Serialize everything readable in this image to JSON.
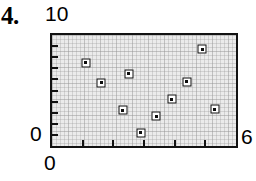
{
  "problem": {
    "number": "4."
  },
  "axis_labels": {
    "y_max": "10",
    "y_min": "0",
    "x_min": "0",
    "x_max": "6"
  },
  "colors": {
    "plot_background": "#ebebeb",
    "frame": "#121212",
    "marker_fill": "#ffffff",
    "marker_edge": "#0d0d0d",
    "text": "#000000"
  },
  "chart_data": {
    "type": "scatter",
    "title": "",
    "xlabel": "",
    "ylabel": "",
    "xlim": [
      0,
      6
    ],
    "ylim": [
      0,
      10
    ],
    "grid": true,
    "legend": null,
    "xticks": [
      0,
      1,
      2,
      3,
      4,
      5,
      6
    ],
    "yticks": [
      0,
      1,
      2,
      3,
      4,
      5,
      6,
      7,
      8,
      9,
      10
    ],
    "xtick_labels": [
      "0",
      "",
      "",
      "",
      "",
      "",
      "6"
    ],
    "ytick_labels": [
      "0",
      "",
      "",
      "",
      "",
      "",
      "",
      "",
      "",
      "",
      "10"
    ],
    "series": [
      {
        "name": "data",
        "marker": "square",
        "points": [
          {
            "x": 1.1,
            "y": 7.5
          },
          {
            "x": 1.6,
            "y": 5.7
          },
          {
            "x": 2.5,
            "y": 6.5
          },
          {
            "x": 2.3,
            "y": 3.2
          },
          {
            "x": 2.9,
            "y": 1.2
          },
          {
            "x": 3.4,
            "y": 2.7
          },
          {
            "x": 3.9,
            "y": 4.2
          },
          {
            "x": 4.4,
            "y": 5.8
          },
          {
            "x": 4.9,
            "y": 8.7
          },
          {
            "x": 5.3,
            "y": 3.3
          }
        ]
      }
    ]
  }
}
